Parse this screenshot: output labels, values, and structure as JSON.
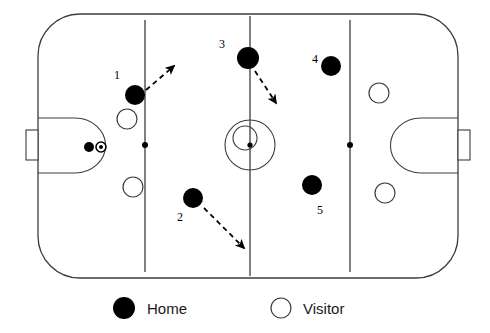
{
  "diagram": {
    "sport": "ice-hockey",
    "colors": {
      "ice": "#ffffff",
      "lines": "#3c3c3c",
      "home_fill": "#000000",
      "visitor_fill": "#ffffff",
      "visitor_stroke": "#3c3c3c",
      "arrow": "#000000",
      "label_text": "#000000",
      "legend_text": "#1a1a1a"
    },
    "rink": {
      "left": 38,
      "top": 14,
      "right": 458,
      "bottom": 278,
      "corner_radius": 42,
      "vertical_lines_x": [
        145,
        250,
        350
      ],
      "center_line_x": 250,
      "center_circle": {
        "cx": 250,
        "cy": 145,
        "r": 25
      },
      "center_inner_circle": {
        "cx": 245,
        "cy": 138,
        "r": 12
      },
      "center_dot": {
        "cx": 250,
        "cy": 145,
        "r": 2.6
      },
      "faceoff_dots": [
        {
          "cx": 145,
          "cy": 145,
          "r": 3
        },
        {
          "cx": 350,
          "cy": 145,
          "r": 3
        }
      ],
      "creases": [
        {
          "side": "left",
          "x": 38,
          "y_top": 118,
          "y_bottom": 173,
          "depth": 62
        },
        {
          "side": "right",
          "x": 458,
          "y_top": 118,
          "y_bottom": 173,
          "depth": 62
        }
      ],
      "nets": [
        {
          "side": "left",
          "x": 26,
          "y": 130,
          "w": 12,
          "h": 30
        },
        {
          "side": "right",
          "x": 458,
          "y": 130,
          "w": 12,
          "h": 30
        }
      ]
    },
    "players": {
      "home": [
        {
          "number": "1",
          "cx": 135,
          "cy": 95,
          "r": 10,
          "label_x": 117,
          "label_y": 79
        },
        {
          "number": "2",
          "cx": 193,
          "cy": 198,
          "r": 10,
          "label_x": 180,
          "label_y": 221
        },
        {
          "number": "3",
          "cx": 248,
          "cy": 58,
          "r": 11,
          "label_x": 222,
          "label_y": 48
        },
        {
          "number": "4",
          "cx": 331,
          "cy": 66,
          "r": 10,
          "label_x": 315,
          "label_y": 63
        },
        {
          "number": "5",
          "cx": 312,
          "cy": 185,
          "r": 10,
          "label_x": 320,
          "label_y": 214
        },
        {
          "number": "",
          "cx": 89,
          "cy": 147,
          "r": 5,
          "label_x": 0,
          "label_y": 0
        }
      ],
      "puck": {
        "cx": 101,
        "cy": 147,
        "r": 5
      },
      "visitors": [
        {
          "cx": 127,
          "cy": 119,
          "r": 10
        },
        {
          "cx": 133,
          "cy": 187,
          "r": 10
        },
        {
          "cx": 379,
          "cy": 93,
          "r": 10
        },
        {
          "cx": 385,
          "cy": 193,
          "r": 10
        }
      ]
    },
    "arrows": [
      {
        "id": "arrow-player-1",
        "from_x": 146,
        "from_y": 90,
        "to_x": 174,
        "to_y": 66
      },
      {
        "id": "arrow-player-2",
        "from_x": 204,
        "from_y": 208,
        "to_x": 244,
        "to_y": 248
      },
      {
        "id": "arrow-player-3",
        "from_x": 255,
        "from_y": 71,
        "to_x": 276,
        "to_y": 103
      }
    ],
    "legend": {
      "home_label": "Home",
      "visitor_label": "Visitor",
      "home_marker": {
        "cx": 124,
        "cy": 308,
        "r": 11
      },
      "visitor_marker": {
        "cx": 281,
        "cy": 308,
        "r": 10
      },
      "home_text_x": 147,
      "visitor_text_x": 303,
      "text_y": 314
    }
  }
}
